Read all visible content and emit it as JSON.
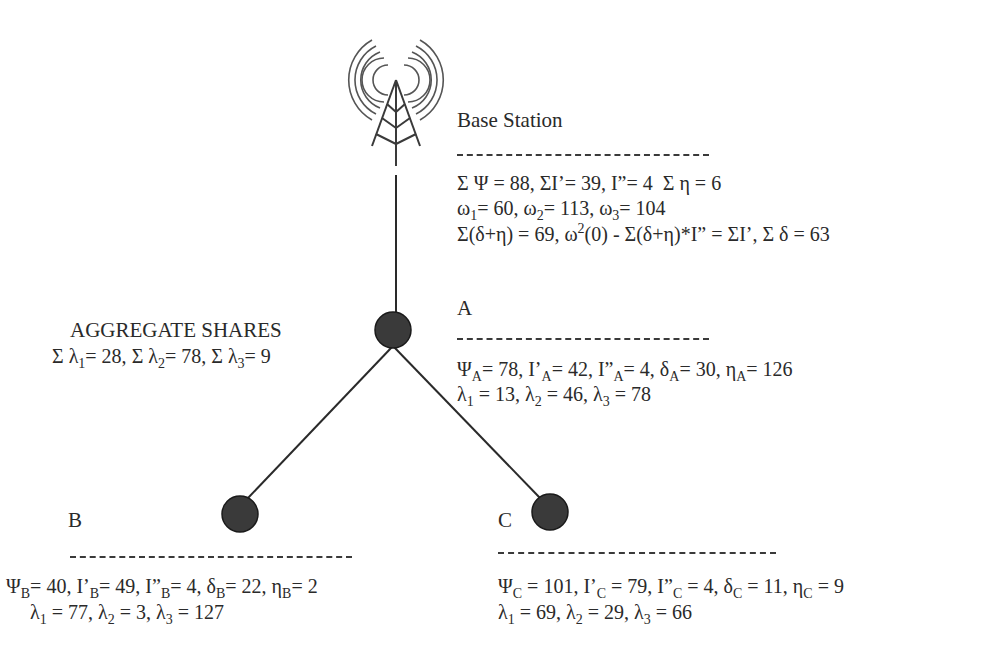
{
  "diagram": {
    "type": "network-topology",
    "colors": {
      "node_fill": "#3a3a3a",
      "line": "#2a2a2a",
      "text": "#2a2a2a"
    },
    "base_station": {
      "icon": "radio-tower-icon",
      "title": "Base Station",
      "line1": {
        "sumPsi": "Σ Ψ = 88,",
        "sumIp": "ΣI’= 39,",
        "Ipp": "I”= 4",
        "sumEta": "Σ η = 6"
      },
      "omega": [
        {
          "sym": "ω",
          "sub": "1",
          "val": "= 60,"
        },
        {
          "sym": "ω",
          "sub": "2",
          "val": "= 113,"
        },
        {
          "sym": "ω",
          "sub": "3",
          "val": "= 104"
        }
      ],
      "line3": {
        "a": "Σ(δ+η) = 69, ω",
        "sup": "2",
        "b": "(0) - Σ(δ+η)*I” = ΣI’, Σ δ = 63"
      }
    },
    "aggregate": {
      "title": "AGGREGATE SHARES",
      "lambdas": [
        {
          "pre": "Σ λ",
          "sub": "1",
          "val": "= 28,"
        },
        {
          "pre": "Σ λ",
          "sub": "2",
          "val": "= 78,"
        },
        {
          "pre": "Σ λ",
          "sub": "3",
          "val": "= 9"
        }
      ]
    },
    "nodes": {
      "A": {
        "label": "A",
        "params": [
          {
            "sym": "Ψ",
            "sub": "A",
            "val": "= 78,"
          },
          {
            "sym": "I’",
            "sub": "A",
            "val": "= 42,"
          },
          {
            "sym": "I”",
            "sub": "A",
            "val": "= 4,"
          },
          {
            "sym": "δ",
            "sub": "A",
            "val": "= 30,"
          },
          {
            "sym": "η",
            "sub": "A",
            "val": "= 126"
          }
        ],
        "lambdas": [
          {
            "sym": "λ",
            "sub": "1",
            "val": "= 13,"
          },
          {
            "sym": "λ",
            "sub": "2",
            "val": "= 46,"
          },
          {
            "sym": "λ",
            "sub": "3",
            "val": "= 78"
          }
        ]
      },
      "B": {
        "label": "B",
        "params": [
          {
            "sym": "Ψ",
            "sub": "B",
            "val": "= 40,"
          },
          {
            "sym": "I’",
            "sub": "B",
            "val": "= 49,"
          },
          {
            "sym": "I”",
            "sub": "B",
            "val": "= 4,"
          },
          {
            "sym": "δ",
            "sub": "B",
            "val": "= 22,"
          },
          {
            "sym": "η",
            "sub": "B",
            "val": "= 2"
          }
        ],
        "lambdas": [
          {
            "sym": "λ",
            "sub": "1",
            "val": "= 77,"
          },
          {
            "sym": "λ",
            "sub": "2",
            "val": "= 3,"
          },
          {
            "sym": "λ",
            "sub": "3",
            "val": "= 127"
          }
        ]
      },
      "C": {
        "label": "C",
        "params": [
          {
            "sym": "Ψ",
            "sub": "C",
            "val": "= 101,"
          },
          {
            "sym": "I’",
            "sub": "C",
            "val": "= 79,"
          },
          {
            "sym": "I”",
            "sub": "C",
            "val": "= 4,"
          },
          {
            "sym": "δ",
            "sub": "C",
            "val": "= 11,"
          },
          {
            "sym": "η",
            "sub": "C",
            "val": "= 9"
          }
        ],
        "lambdas": [
          {
            "sym": "λ",
            "sub": "1",
            "val": "= 69,"
          },
          {
            "sym": "λ",
            "sub": "2",
            "val": "= 29,"
          },
          {
            "sym": "λ",
            "sub": "3",
            "val": "= 66"
          }
        ]
      }
    }
  }
}
